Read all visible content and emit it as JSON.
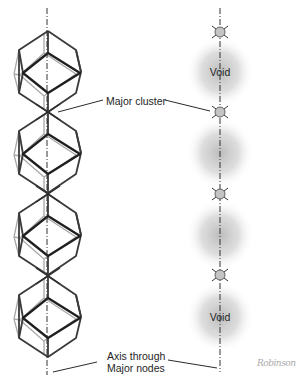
{
  "figure": {
    "colors": {
      "bold_edge": "#2a2a2a",
      "front_edge": "#3c3c3c",
      "back_edge": "#a8a8a8",
      "axis": "#333333",
      "void_fill": "#bcbcbc",
      "node_fill": "#c4c4c4"
    },
    "left_column": {
      "description": "Chain of 4 polyhedra joined at major nodes along vertical axis",
      "unit_count": 4,
      "unit_centers_y": [
        72,
        153,
        235,
        317
      ]
    },
    "right_column": {
      "nodes_y": [
        32,
        112,
        194,
        275
      ],
      "voids": [
        {
          "y": 72,
          "label": "Void"
        },
        {
          "y": 153,
          "label": ""
        },
        {
          "y": 235,
          "label": ""
        },
        {
          "y": 317,
          "label": "Void"
        }
      ]
    },
    "labels": {
      "major_cluster": "Major cluster",
      "axis_line1": "Axis through",
      "axis_line2": "Major nodes"
    },
    "logo": "Robinson"
  }
}
